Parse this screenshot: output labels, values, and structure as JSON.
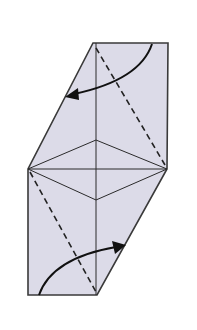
{
  "diagram": {
    "type": "origami-fold-step",
    "colors": {
      "paper_fill": "#dcdbe8",
      "outline": "#3a3a3a",
      "crease": "#2a2a2a",
      "arrow": "#111111",
      "background": "#ffffff"
    },
    "paper": {
      "shape": "hexagon",
      "points": [
        [
          93,
          43
        ],
        [
          168,
          43
        ],
        [
          167,
          169
        ],
        [
          97,
          295
        ],
        [
          28,
          295
        ],
        [
          28,
          169
        ]
      ]
    },
    "creases": {
      "center_vertical": [
        [
          96,
          43
        ],
        [
          96,
          295
        ]
      ],
      "horizontal_mid": [
        [
          28,
          169
        ],
        [
          167,
          169
        ]
      ],
      "diamond": [
        [
          28,
          169
        ],
        [
          96,
          140
        ],
        [
          167,
          169
        ],
        [
          96,
          200
        ]
      ]
    },
    "valley_folds": [
      {
        "id": "upper",
        "from": [
          96,
          48
        ],
        "to": [
          165,
          165
        ]
      },
      {
        "id": "lower",
        "from": [
          30,
          172
        ],
        "to": [
          96,
          292
        ]
      }
    ],
    "arrows": [
      {
        "id": "upper-fold-arrow",
        "direction": "left",
        "start": [
          152,
          44
        ],
        "end": [
          66,
          97
        ]
      },
      {
        "id": "lower-fold-arrow",
        "direction": "right",
        "start": [
          39,
          295
        ],
        "end": [
          125,
          245
        ]
      }
    ]
  }
}
